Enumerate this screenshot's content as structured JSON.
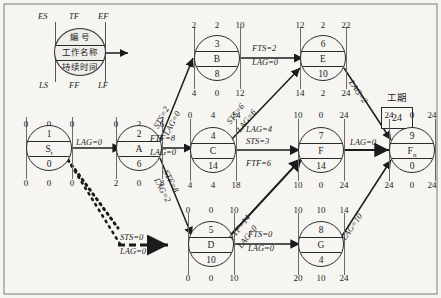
{
  "legend": {
    "top_left": "ES",
    "top_mid": "TF",
    "top_right": "EF",
    "bottom_left": "LS",
    "bottom_mid": "FF",
    "bottom_right": "LF",
    "row1": "编  号",
    "row2": "工作名称",
    "row3": "持续时间"
  },
  "duration": {
    "label": "工期",
    "value": "24"
  },
  "nodes": [
    {
      "id": "1",
      "name": "S",
      "sub": "t",
      "dur": "0",
      "es": "0",
      "tf": "0",
      "ef": "0",
      "ls": "0",
      "ff": "0",
      "lf": "0"
    },
    {
      "id": "2",
      "name": "A",
      "sub": "",
      "dur": "6",
      "es": "0",
      "tf": "2",
      "ef": "6",
      "ls": "2",
      "ff": "0",
      "lf": "8"
    },
    {
      "id": "3",
      "name": "B",
      "sub": "",
      "dur": "8",
      "es": "2",
      "tf": "2",
      "ef": "10",
      "ls": "4",
      "ff": "0",
      "lf": "12"
    },
    {
      "id": "4",
      "name": "C",
      "sub": "",
      "dur": "14",
      "es": "0",
      "tf": "4",
      "ef": "14",
      "ls": "4",
      "ff": "4",
      "lf": "18"
    },
    {
      "id": "5",
      "name": "D",
      "sub": "",
      "dur": "10",
      "es": "0",
      "tf": "0",
      "ef": "10",
      "ls": "0",
      "ff": "0",
      "lf": "10"
    },
    {
      "id": "6",
      "name": "E",
      "sub": "",
      "dur": "10",
      "es": "12",
      "tf": "2",
      "ef": "22",
      "ls": "14",
      "ff": "2",
      "lf": "24"
    },
    {
      "id": "7",
      "name": "F",
      "sub": "",
      "dur": "14",
      "es": "10",
      "tf": "0",
      "ef": "24",
      "ls": "10",
      "ff": "0",
      "lf": "24"
    },
    {
      "id": "8",
      "name": "G",
      "sub": "",
      "dur": "4",
      "es": "10",
      "tf": "10",
      "ef": "14",
      "ls": "20",
      "ff": "10",
      "lf": "24"
    },
    {
      "id": "9",
      "name": "F",
      "sub": "n",
      "dur": "0",
      "es": "24",
      "tf": "0",
      "ef": "24",
      "ls": "24",
      "ff": "0",
      "lf": "24"
    }
  ],
  "edges": [
    {
      "from": "1",
      "to": "2",
      "l1": "LAG=0",
      "l2": ""
    },
    {
      "from": "1",
      "to": "5",
      "l1": "STS=0",
      "l2": "LAG=0"
    },
    {
      "from": "2",
      "to": "3",
      "l1": "STS=2",
      "l2": "LAG=0"
    },
    {
      "from": "2",
      "to": "4",
      "l1": "FTF=8",
      "l2": "LAG=0"
    },
    {
      "from": "2",
      "to": "5",
      "l1": "STF=8",
      "l2": "LAG=2"
    },
    {
      "from": "3",
      "to": "6",
      "l1": "FTS=2",
      "l2": "LAG=0"
    },
    {
      "from": "4",
      "to": "6",
      "l1": "STS=6",
      "l2": "LAG=6"
    },
    {
      "from": "4",
      "to": "7",
      "l1": "LAG=4",
      "l2": "STS=3",
      "l3": "FTF=6"
    },
    {
      "from": "5",
      "to": "7",
      "l1": "FTF=14",
      "l2": "LAG=0"
    },
    {
      "from": "5",
      "to": "8",
      "l1": "FTS=0",
      "l2": "LAG=0"
    },
    {
      "from": "6",
      "to": "9",
      "l1": "LAG=2",
      "l2": ""
    },
    {
      "from": "7",
      "to": "9",
      "l1": "LAG=0",
      "l2": ""
    },
    {
      "from": "8",
      "to": "9",
      "l1": "LAG=10",
      "l2": ""
    }
  ]
}
